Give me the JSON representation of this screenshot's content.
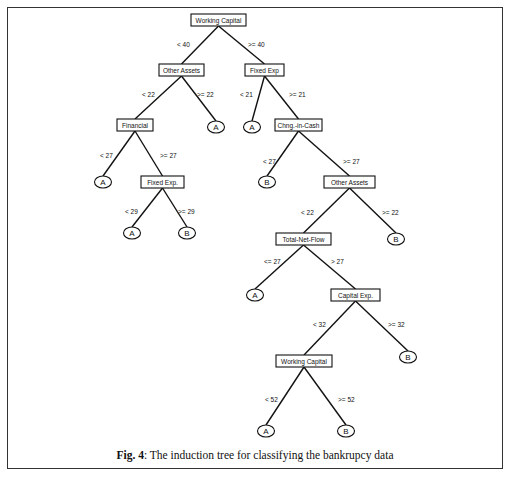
{
  "figure": {
    "caption_label": "Fig. 4",
    "caption_text": ": The induction tree for classifying the bankrupcy data"
  },
  "tree": {
    "nodes": [
      {
        "id": "n1",
        "type": "split",
        "label": "Working  Capital",
        "x": 191,
        "y": 14,
        "w": 55,
        "h": 12
      },
      {
        "id": "n2",
        "type": "split",
        "label": "Other  Assets",
        "x": 159,
        "y": 64,
        "w": 45,
        "h": 12
      },
      {
        "id": "n3",
        "type": "split",
        "label": "Fixed Exp",
        "x": 245,
        "y": 64,
        "w": 39,
        "h": 12
      },
      {
        "id": "n4",
        "type": "split",
        "label": "Financial",
        "x": 117,
        "y": 119,
        "w": 36,
        "h": 12
      },
      {
        "id": "l1",
        "type": "leaf",
        "label": "A",
        "cx": 216,
        "cy": 127
      },
      {
        "id": "l2",
        "type": "leaf",
        "label": "A",
        "cx": 252,
        "cy": 127
      },
      {
        "id": "n5",
        "type": "split",
        "label": "Chng.-in-Cash",
        "x": 275,
        "y": 119,
        "w": 47,
        "h": 12
      },
      {
        "id": "l3",
        "type": "leaf",
        "label": "A",
        "cx": 103,
        "cy": 182
      },
      {
        "id": "n6",
        "type": "split",
        "label": "Fixed Exp.",
        "x": 141,
        "y": 176,
        "w": 43,
        "h": 12
      },
      {
        "id": "l4",
        "type": "leaf",
        "label": "B",
        "cx": 267,
        "cy": 182
      },
      {
        "id": "n7",
        "type": "split",
        "label": "Other Assets",
        "x": 324,
        "y": 176,
        "w": 51,
        "h": 12
      },
      {
        "id": "l5",
        "type": "leaf",
        "label": "A",
        "cx": 132,
        "cy": 233
      },
      {
        "id": "l6",
        "type": "leaf",
        "label": "B",
        "cx": 187,
        "cy": 233
      },
      {
        "id": "n8",
        "type": "split",
        "label": "Total-Net-Flow",
        "x": 276,
        "y": 233,
        "w": 55,
        "h": 12
      },
      {
        "id": "l7",
        "type": "leaf",
        "label": "B",
        "cx": 396,
        "cy": 239
      },
      {
        "id": "l8",
        "type": "leaf",
        "label": "A",
        "cx": 255,
        "cy": 295
      },
      {
        "id": "n9",
        "type": "split",
        "label": "Capital Exp.",
        "x": 331,
        "y": 289,
        "w": 49,
        "h": 12
      },
      {
        "id": "l9",
        "type": "leaf",
        "label": "B",
        "cx": 408,
        "cy": 357
      },
      {
        "id": "n10",
        "type": "split",
        "label": "Working Capital",
        "x": 276,
        "y": 355,
        "w": 56,
        "h": 12
      },
      {
        "id": "l10",
        "type": "leaf",
        "label": "A",
        "cx": 266,
        "cy": 431
      },
      {
        "id": "l11",
        "type": "leaf",
        "label": "B",
        "cx": 346,
        "cy": 431
      }
    ],
    "edges": [
      {
        "from": "n1",
        "to": "n2",
        "label": "< 40",
        "lx": 177,
        "ly": 47
      },
      {
        "from": "n1",
        "to": "n3",
        "label": ">= 40",
        "lx": 248,
        "ly": 47
      },
      {
        "from": "n2",
        "to": "n4",
        "label": "< 22",
        "lx": 142,
        "ly": 97
      },
      {
        "from": "n2",
        "to": "l1",
        "label": ">= 22",
        "lx": 197,
        "ly": 97
      },
      {
        "from": "n3",
        "to": "l2",
        "label": "< 21",
        "lx": 240,
        "ly": 97
      },
      {
        "from": "n3",
        "to": "n5",
        "label": ">= 21",
        "lx": 289,
        "ly": 97
      },
      {
        "from": "n4",
        "to": "l3",
        "label": "< 27",
        "lx": 100,
        "ly": 158
      },
      {
        "from": "n4",
        "to": "n6",
        "label": ">= 27",
        "lx": 160,
        "ly": 158
      },
      {
        "from": "n5",
        "to": "l4",
        "label": "< 27",
        "lx": 263,
        "ly": 164
      },
      {
        "from": "n5",
        "to": "n7",
        "label": ">= 27",
        "lx": 343,
        "ly": 164
      },
      {
        "from": "n6",
        "to": "l5",
        "label": "< 29",
        "lx": 125,
        "ly": 214
      },
      {
        "from": "n6",
        "to": "l6",
        "label": ">= 29",
        "lx": 178,
        "ly": 214
      },
      {
        "from": "n7",
        "to": "n8",
        "label": "< 22",
        "lx": 301,
        "ly": 215
      },
      {
        "from": "n7",
        "to": "l7",
        "label": ">= 22",
        "lx": 382,
        "ly": 215
      },
      {
        "from": "n8",
        "to": "l8",
        "label": "<= 27",
        "lx": 264,
        "ly": 264
      },
      {
        "from": "n8",
        "to": "n9",
        "label": "> 27",
        "lx": 331,
        "ly": 264
      },
      {
        "from": "n9",
        "to": "n10",
        "label": "< 32",
        "lx": 313,
        "ly": 327
      },
      {
        "from": "n9",
        "to": "l9",
        "label": ">= 32",
        "lx": 388,
        "ly": 327
      },
      {
        "from": "n10",
        "to": "l10",
        "label": "< 52",
        "lx": 265,
        "ly": 402
      },
      {
        "from": "n10",
        "to": "l11",
        "label": ">= 52",
        "lx": 338,
        "ly": 402
      }
    ]
  }
}
